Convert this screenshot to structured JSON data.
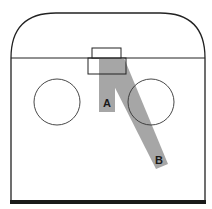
{
  "diagram": {
    "type": "hockey-offensive-zone",
    "colors": {
      "line": "#222222",
      "lane_fill": "#a6a6a6",
      "background": "#ffffff",
      "bottom_line": "#1a1a1a"
    },
    "lanes": [
      {
        "id": "A",
        "label": "A"
      },
      {
        "id": "B",
        "label": "B"
      }
    ],
    "elements": {
      "boards": "rounded end boards",
      "goal_line": "goal line",
      "goal": "goal net",
      "crease": "goal crease",
      "faceoff_circles": [
        "left faceoff circle",
        "right faceoff circle"
      ],
      "blue_line": "zone line (bottom)"
    }
  }
}
